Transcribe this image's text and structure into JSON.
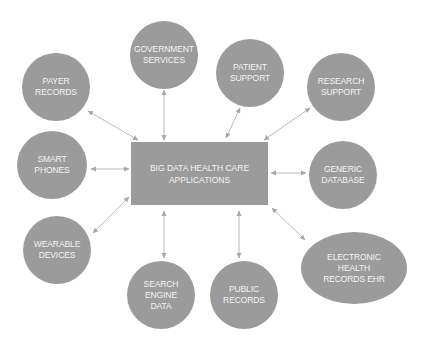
{
  "diagram": {
    "colors": {
      "node_fill": "#9b9b9b",
      "text": "#f4f4f4",
      "edge": "#b9b9b9",
      "background": "#ffffff"
    },
    "center": {
      "label": "BIG DATA HEALTH CARE\nAPPLICATIONS",
      "x": 131,
      "y": 142,
      "w": 137,
      "h": 63
    },
    "nodes": [
      {
        "id": "payer-records",
        "label": "PAYER\nRECORDS",
        "cx": 56,
        "cy": 87,
        "rx": 34,
        "ry": 34
      },
      {
        "id": "government-services",
        "label": "GOVERNMENT\nSERVICES",
        "cx": 164,
        "cy": 55,
        "rx": 34,
        "ry": 34
      },
      {
        "id": "patient-support",
        "label": "PATIENT\nSUPPORT",
        "cx": 250,
        "cy": 73,
        "rx": 34,
        "ry": 34
      },
      {
        "id": "research-support",
        "label": "RESEARCH\nSUPPORT",
        "cx": 341,
        "cy": 87,
        "rx": 34,
        "ry": 34
      },
      {
        "id": "smart-phones",
        "label": "SMART\nPHONES",
        "cx": 52,
        "cy": 165,
        "rx": 35,
        "ry": 34
      },
      {
        "id": "generic-database",
        "label": "GENERIC\nDATABASE",
        "cx": 343,
        "cy": 175,
        "rx": 34,
        "ry": 34
      },
      {
        "id": "wearable-devices",
        "label": "WEARABLE\nDEVICES",
        "cx": 57,
        "cy": 250,
        "rx": 34,
        "ry": 34
      },
      {
        "id": "electronic-health-records-ehr",
        "label": "ELECTRONIC\nHEALTH\nRECORDS EHR",
        "cx": 354,
        "cy": 268,
        "rx": 53,
        "ry": 36
      },
      {
        "id": "search-engine-data",
        "label": "SEARCH\nENGINE\nDATA",
        "cx": 161,
        "cy": 295,
        "rx": 34,
        "ry": 34
      },
      {
        "id": "public-records",
        "label": "PUBLIC\nRECORDS",
        "cx": 244,
        "cy": 295,
        "rx": 34,
        "ry": 34
      }
    ],
    "edges": [
      {
        "to": "payer-records",
        "x1": 138,
        "y1": 140,
        "x2": 88,
        "y2": 111
      },
      {
        "to": "government-services",
        "x1": 164,
        "y1": 140,
        "x2": 164,
        "y2": 90
      },
      {
        "to": "patient-support",
        "x1": 226,
        "y1": 138,
        "x2": 240,
        "y2": 108
      },
      {
        "to": "research-support",
        "x1": 264,
        "y1": 140,
        "x2": 310,
        "y2": 108
      },
      {
        "to": "smart-phones",
        "x1": 129,
        "y1": 169,
        "x2": 91,
        "y2": 169
      },
      {
        "to": "generic-database",
        "x1": 271,
        "y1": 173,
        "x2": 306,
        "y2": 173
      },
      {
        "to": "wearable-devices",
        "x1": 129,
        "y1": 197,
        "x2": 93,
        "y2": 233
      },
      {
        "to": "electronic-health-records-ehr",
        "x1": 272,
        "y1": 208,
        "x2": 305,
        "y2": 240
      },
      {
        "to": "search-engine-data",
        "x1": 164,
        "y1": 211,
        "x2": 164,
        "y2": 258
      },
      {
        "to": "public-records",
        "x1": 239,
        "y1": 211,
        "x2": 239,
        "y2": 258
      }
    ],
    "edge_style": "bidirectional-arrow"
  }
}
